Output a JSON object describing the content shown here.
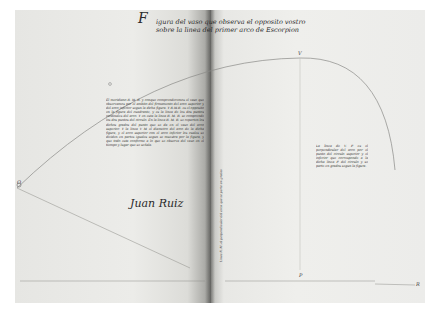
{
  "document": {
    "type": "manuscript-spread",
    "heading": {
      "initial": "F",
      "line1": "igura del vaso que observa el opposito vostro",
      "line2": "sobre la linea del primer arco de Escorpion"
    },
    "main_text": "El meridiano R. M. R. y conque comprenderemos el vaso que observamos por el ambito del firmamento del arco superior y del arco inferior segun la dicha figura. Y R.M.R. es el opposito en la figura del cuadrante, y es la linea de los dos puntos cardinales del arco. Y en esta la linea R. M. R. se comprende los dos puntos del circulo. En la linea R. M. R. se reparten los dichos grados del punto que se da en el vaso del arco superior. Y la linea V M el diametro del arco de la dicha figura, y el arco superior con el arco inferior los cuales se dividen en partes iguales segun se muestra por la figura, y que todo esta conforme a lo que se observa del vaso en el tiempo y lugar que se señala.",
    "signature": "Juan Ruiz",
    "side_note": "La linea de V. P. es el perpendicular del arco por el punto del circulo superior y el inferior que corresponde a la dicha linea P. del circulo y se parte en grados segun la figura.",
    "vertical_note": "Linea R. M. el perpendicular del arco que se parte en grados",
    "labels": {
      "top_point": "V",
      "bottom_point": "P",
      "left_point": "O",
      "right_end": "R"
    },
    "colors": {
      "paper": "#ececea",
      "ink": "#2a2a2a",
      "gutter": "#8f8f8b"
    }
  }
}
